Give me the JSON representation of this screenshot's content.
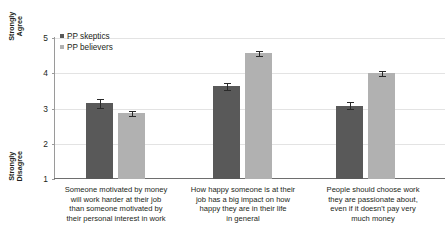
{
  "chart_data": {
    "type": "bar",
    "title": "",
    "xlabel": "",
    "ylabel": "",
    "ylim": [
      1,
      5
    ],
    "yticks": [
      1,
      2,
      3,
      4,
      5
    ],
    "ytick_labels": [
      "1",
      "2",
      "3",
      "4",
      "5"
    ],
    "y_axis_top_label": [
      "Strongly",
      "Agree"
    ],
    "y_axis_bottom_label": [
      "Strongly",
      "Disagree"
    ],
    "grid": true,
    "legend_position": "top-left",
    "categories": [
      "Someone motivated by money will work harder at their job than someone motivated by their personal interest in work",
      "How happy someone is at their job has a big impact on how happy they are in their life in general",
      "People should choose work they are passionate about, even if it doesn't pay very much money"
    ],
    "category_lines": [
      [
        "Someone motivated by money",
        "will work harder at their job",
        "than someone motivated by",
        "their personal interest in work"
      ],
      [
        "How happy someone is at their",
        "job has a big impact on how",
        "happy they are in their life",
        "in general"
      ],
      [
        "People should choose work",
        "they are passionate about,",
        "even if it doesn't pay very",
        "much money"
      ]
    ],
    "series": [
      {
        "name": "PP skeptics",
        "color": "#595959",
        "values": [
          3.15,
          3.63,
          3.08
        ],
        "errors": [
          0.13,
          0.1,
          0.1
        ]
      },
      {
        "name": "PP believers",
        "color": "#b1b1b1",
        "values": [
          2.86,
          4.57,
          4.0
        ],
        "errors": [
          0.07,
          0.07,
          0.07
        ]
      }
    ]
  },
  "legend": {
    "items": [
      {
        "label": "PP skeptics",
        "swatch": "skeptic"
      },
      {
        "label": "PP believers",
        "swatch": "believer"
      }
    ]
  }
}
